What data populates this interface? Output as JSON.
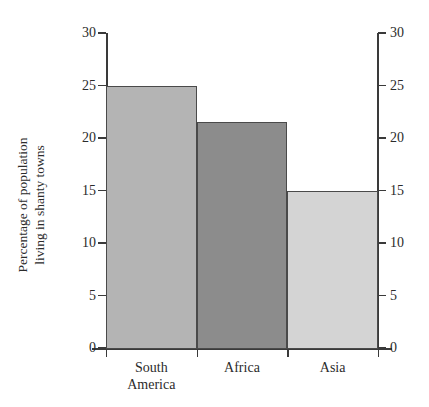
{
  "chart_data": {
    "type": "bar",
    "title": "",
    "categories": [
      "South America",
      "Africa",
      "Asia"
    ],
    "category_lines": [
      [
        "South",
        "America"
      ],
      [
        "Africa"
      ],
      [
        "Asia"
      ]
    ],
    "values": [
      25,
      21.5,
      15
    ],
    "xlabel": "",
    "ylabel": "Percentage of population living in shanty towns",
    "ylabel_lines": [
      "Percentage of population",
      "living in shanty towns"
    ],
    "ylim": [
      0,
      30
    ],
    "ytick_values": [
      0,
      5,
      10,
      15,
      20,
      25,
      30
    ],
    "ytick_labels": [
      "0",
      "5",
      "10",
      "15",
      "20",
      "25",
      "30"
    ],
    "right_axis": {
      "visible": true,
      "ylim": [
        0,
        30
      ],
      "ytick_values": [
        0,
        5,
        10,
        15,
        20,
        25,
        30
      ],
      "ytick_labels": [
        "0",
        "5",
        "10",
        "15",
        "20",
        "25",
        "30"
      ]
    },
    "grid": false,
    "legend": null,
    "bar_colors": [
      "#b4b4b4",
      "#8c8c8c",
      "#d4d4d4"
    ],
    "bar_edge_color": "#4a4a4a",
    "axis_color": "#3a3a3a",
    "text_color": "#2b2b2b",
    "background": "#ffffff"
  },
  "axis_titles": {
    "y_left": "Percentage of population living in shanty towns"
  }
}
